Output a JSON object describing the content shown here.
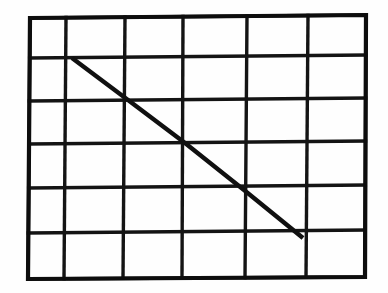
{
  "figure": {
    "title": "Rectangular grid with a diagonal line",
    "type": "line-drawing",
    "background_color": "#fefefe",
    "ink_color": "#101010",
    "canvas": {
      "width": 388,
      "height": 293
    }
  },
  "grid": {
    "columns": 6,
    "rows": 6,
    "cell_count": 36,
    "line_color": "#141414",
    "line_width_px": 3.4,
    "border_width_px": 4.2,
    "corners": {
      "top_left": [
        30,
        18
      ],
      "top_right": [
        366,
        15
      ],
      "bottom_right": [
        365,
        277
      ],
      "bottom_left": [
        28,
        279
      ]
    },
    "vertical_line_x_top": [
      30,
      66,
      125,
      183,
      247,
      308,
      366
    ],
    "vertical_line_x_bottom": [
      28,
      64,
      123,
      182,
      245,
      306,
      365
    ],
    "horizontal_line_y_left": [
      18,
      58,
      101,
      144,
      188,
      233,
      279
    ],
    "horizontal_line_y_right": [
      15,
      55,
      98,
      141,
      185,
      230,
      277
    ]
  },
  "diagonal": {
    "label": "diagonal line",
    "color": "#101010",
    "width_px": 4.4,
    "start_point": [
      72,
      58
    ],
    "end_point": [
      303,
      238
    ],
    "start_cell": {
      "column": 2,
      "row": 2
    },
    "end_cell": {
      "column": 6,
      "row": 6
    },
    "intersections": [
      [
        72,
        58
      ],
      [
        128,
        100
      ],
      [
        185,
        143
      ],
      [
        244,
        190
      ],
      [
        303,
        238
      ]
    ],
    "spans_columns": 4,
    "spans_rows": 4
  }
}
